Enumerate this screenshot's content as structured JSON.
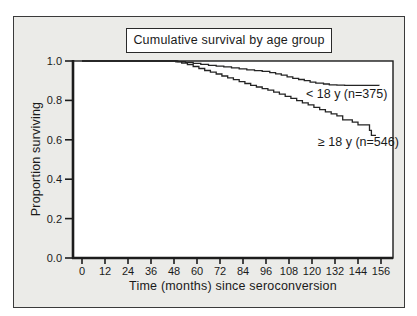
{
  "chart_data": {
    "type": "line",
    "subtype": "kaplan-meier-step",
    "title": "Cumulative survival by age group",
    "xlabel": "Time (months) since seroconversion",
    "ylabel": "Proportion surviving",
    "xlim": [
      0,
      156
    ],
    "ylim": [
      0.0,
      1.0
    ],
    "x_ticks": [
      0,
      12,
      24,
      36,
      48,
      60,
      72,
      84,
      96,
      108,
      120,
      132,
      144,
      156
    ],
    "y_ticks": [
      "0.0",
      "0.2",
      "0.4",
      "0.6",
      "0.8",
      "1.0"
    ],
    "grid": false,
    "legend_position": "inline-labels",
    "colors": {
      "curve": "#242424",
      "frame": "#1c1c1c",
      "panel_background": "#ebebe8",
      "plot_background": "#ffffff",
      "text": "#1a1a1a"
    },
    "series": [
      {
        "name": "< 18 y (n=375)",
        "points": [
          [
            0,
            1.0
          ],
          [
            46,
            1.0
          ],
          [
            50,
            0.997
          ],
          [
            54,
            0.993
          ],
          [
            58,
            0.988
          ],
          [
            62,
            0.983
          ],
          [
            66,
            0.978
          ],
          [
            70,
            0.974
          ],
          [
            74,
            0.97
          ],
          [
            78,
            0.965
          ],
          [
            82,
            0.96
          ],
          [
            86,
            0.955
          ],
          [
            90,
            0.951
          ],
          [
            94,
            0.947
          ],
          [
            98,
            0.941
          ],
          [
            101,
            0.935
          ],
          [
            104,
            0.928
          ],
          [
            107,
            0.92
          ],
          [
            110,
            0.912
          ],
          [
            113,
            0.906
          ],
          [
            116,
            0.9
          ],
          [
            119,
            0.893
          ],
          [
            122,
            0.888
          ],
          [
            126,
            0.883
          ],
          [
            129,
            0.879
          ],
          [
            133,
            0.877
          ],
          [
            137,
            0.876
          ],
          [
            155,
            0.875
          ]
        ]
      },
      {
        "name": "≥ 18 y (n=546)",
        "points": [
          [
            0,
            1.0
          ],
          [
            47,
            1.0
          ],
          [
            49,
            0.996
          ],
          [
            52,
            0.99
          ],
          [
            55,
            0.982
          ],
          [
            58,
            0.972
          ],
          [
            61,
            0.962
          ],
          [
            64,
            0.952
          ],
          [
            67,
            0.943
          ],
          [
            70,
            0.934
          ],
          [
            73,
            0.924
          ],
          [
            76,
            0.914
          ],
          [
            79,
            0.905
          ],
          [
            82,
            0.895
          ],
          [
            85,
            0.886
          ],
          [
            88,
            0.876
          ],
          [
            91,
            0.868
          ],
          [
            94,
            0.86
          ],
          [
            97,
            0.852
          ],
          [
            100,
            0.842
          ],
          [
            103,
            0.832
          ],
          [
            106,
            0.821
          ],
          [
            109,
            0.81
          ],
          [
            112,
            0.799
          ],
          [
            115,
            0.788
          ],
          [
            118,
            0.777
          ],
          [
            121,
            0.765
          ],
          [
            124,
            0.753
          ],
          [
            127,
            0.742
          ],
          [
            130,
            0.732
          ],
          [
            133,
            0.722
          ],
          [
            136,
            0.701
          ],
          [
            141,
            0.69
          ],
          [
            144,
            0.676
          ],
          [
            150,
            0.648
          ],
          [
            151,
            0.623
          ],
          [
            153,
            0.62
          ]
        ]
      }
    ]
  }
}
